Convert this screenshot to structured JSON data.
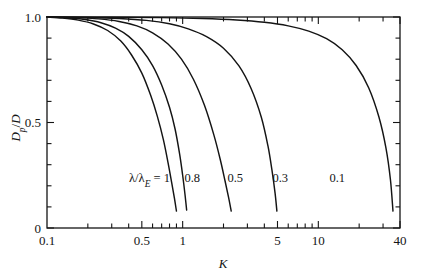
{
  "chart_data": {
    "type": "line",
    "title": "",
    "subtitle": "",
    "xlabel": "K",
    "ylabel": "Dp/D",
    "ylabel_parts": {
      "main": "D",
      "sub": "p",
      "denom": "/D"
    },
    "xscale": "log",
    "yscale": "linear",
    "xlim": [
      0.1,
      40
    ],
    "ylim": [
      0,
      1.0
    ],
    "grid": false,
    "legend": "inline-curve-labels",
    "legend_prefix": "λ/λE =",
    "x_tick_labels": [
      {
        "value": 0.1,
        "label": "0.1"
      },
      {
        "value": 0.5,
        "label": "0.5"
      },
      {
        "value": 1,
        "label": "1"
      },
      {
        "value": 5,
        "label": "5"
      },
      {
        "value": 10,
        "label": "10"
      },
      {
        "value": 40,
        "label": "40"
      }
    ],
    "x_minor_ticks": [
      0.2,
      0.3,
      0.4,
      0.5,
      0.6,
      0.7,
      0.8,
      0.9,
      1,
      2,
      3,
      4,
      5,
      6,
      7,
      8,
      9,
      10,
      20,
      30,
      40
    ],
    "y_tick_labels": [
      {
        "value": 1.0,
        "label": "1.0"
      },
      {
        "value": 0.5,
        "label": "0.5"
      },
      {
        "value": 0.0,
        "label": "0"
      }
    ],
    "y_minor_ticks": [
      0.1,
      0.2,
      0.3,
      0.4,
      0.6,
      0.7,
      0.8,
      0.9
    ],
    "series": [
      {
        "name": "1",
        "label": "λ/λE = 1",
        "label_text": "1",
        "x": [
          0.1,
          0.13,
          0.17,
          0.22,
          0.28,
          0.35,
          0.42,
          0.5,
          0.58,
          0.65,
          0.72,
          0.78,
          0.83,
          0.87,
          0.9
        ],
        "y": [
          1.0,
          0.995,
          0.985,
          0.967,
          0.936,
          0.886,
          0.82,
          0.734,
          0.63,
          0.53,
          0.42,
          0.31,
          0.215,
          0.14,
          0.08
        ]
      },
      {
        "name": "0.8",
        "label": "0.8",
        "label_text": "0.8",
        "x": [
          0.1,
          0.14,
          0.19,
          0.25,
          0.32,
          0.4,
          0.5,
          0.6,
          0.7,
          0.8,
          0.88,
          0.95,
          1.0,
          1.04,
          1.07
        ],
        "y": [
          1.0,
          0.996,
          0.988,
          0.973,
          0.947,
          0.908,
          0.845,
          0.77,
          0.678,
          0.572,
          0.468,
          0.35,
          0.25,
          0.16,
          0.085
        ]
      },
      {
        "name": "0.5",
        "label": "0.5",
        "label_text": "0.5",
        "x": [
          0.1,
          0.16,
          0.24,
          0.34,
          0.46,
          0.6,
          0.78,
          0.98,
          1.2,
          1.45,
          1.7,
          1.9,
          2.05,
          2.18,
          2.28
        ],
        "y": [
          1.0,
          0.997,
          0.991,
          0.979,
          0.958,
          0.925,
          0.872,
          0.8,
          0.705,
          0.58,
          0.44,
          0.32,
          0.225,
          0.145,
          0.08
        ]
      },
      {
        "name": "0.3",
        "label": "0.3",
        "label_text": "0.3",
        "x": [
          0.1,
          0.2,
          0.34,
          0.54,
          0.8,
          1.1,
          1.5,
          2.0,
          2.6,
          3.2,
          3.8,
          4.25,
          4.55,
          4.8,
          4.95
        ],
        "y": [
          1.0,
          0.998,
          0.993,
          0.984,
          0.968,
          0.944,
          0.907,
          0.852,
          0.768,
          0.66,
          0.525,
          0.39,
          0.275,
          0.165,
          0.08
        ]
      },
      {
        "name": "0.1",
        "label": "0.1",
        "label_text": "0.1",
        "x": [
          0.1,
          0.3,
          0.7,
          1.4,
          2.5,
          4.0,
          6.0,
          8.5,
          11.5,
          15.0,
          19.0,
          23.5,
          28.0,
          31.5,
          34.0,
          35.5
        ],
        "y": [
          1.0,
          0.999,
          0.997,
          0.993,
          0.986,
          0.975,
          0.958,
          0.933,
          0.897,
          0.845,
          0.77,
          0.665,
          0.525,
          0.38,
          0.23,
          0.08
        ]
      }
    ],
    "curve_label_positions": [
      {
        "name": "1",
        "x_px": 170,
        "y_px": 182
      },
      {
        "name": "0.8",
        "x_px": 200,
        "y_px": 182
      },
      {
        "name": "0.5",
        "x_px": 243,
        "y_px": 182
      },
      {
        "name": "0.3",
        "x_px": 288,
        "y_px": 182
      },
      {
        "name": "0.1",
        "x_px": 345,
        "y_px": 182
      }
    ],
    "colors": {
      "line": "#141414",
      "axis": "#141414",
      "background": "#ffffff"
    }
  }
}
